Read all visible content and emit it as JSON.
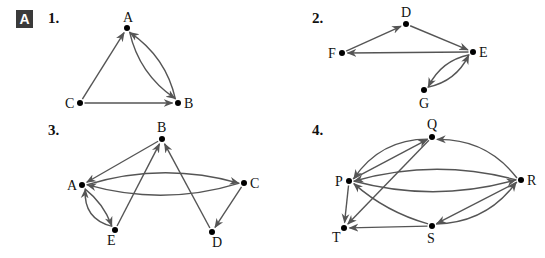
{
  "section_badge": "A",
  "edge_color": "#555555",
  "graphs": [
    {
      "number": "1.",
      "nodes": [
        {
          "id": "A",
          "x": 127,
          "y": 28,
          "label_dx": -4,
          "label_dy": -6
        },
        {
          "id": "B",
          "x": 178,
          "y": 103,
          "label_dx": 6,
          "label_dy": 5
        },
        {
          "id": "C",
          "x": 80,
          "y": 103,
          "label_dx": -15,
          "label_dy": 5
        }
      ],
      "edges": [
        {
          "from": "C",
          "to": "A",
          "curve": 0
        },
        {
          "from": "C",
          "to": "B",
          "curve": 0
        },
        {
          "from": "A",
          "to": "B",
          "curve": 10
        },
        {
          "from": "B",
          "to": "A",
          "curve": 10
        }
      ]
    },
    {
      "number": "2.",
      "nodes": [
        {
          "id": "D",
          "x": 406,
          "y": 24,
          "label_dx": -5,
          "label_dy": -7
        },
        {
          "id": "E",
          "x": 473,
          "y": 52,
          "label_dx": 6,
          "label_dy": 5
        },
        {
          "id": "F",
          "x": 342,
          "y": 53,
          "label_dx": -14,
          "label_dy": 5
        },
        {
          "id": "G",
          "x": 424,
          "y": 90,
          "label_dx": -5,
          "label_dy": 18
        }
      ],
      "edges": [
        {
          "from": "F",
          "to": "D",
          "curve": 0
        },
        {
          "from": "D",
          "to": "E",
          "curve": 0
        },
        {
          "from": "E",
          "to": "F",
          "curve": 0
        },
        {
          "from": "E",
          "to": "G",
          "curve": 8
        },
        {
          "from": "G",
          "to": "E",
          "curve": 8
        }
      ]
    },
    {
      "number": "3.",
      "nodes": [
        {
          "id": "B",
          "x": 162,
          "y": 139,
          "label_dx": -5,
          "label_dy": -7
        },
        {
          "id": "A",
          "x": 82,
          "y": 185,
          "label_dx": -15,
          "label_dy": 5
        },
        {
          "id": "C",
          "x": 244,
          "y": 183,
          "label_dx": 6,
          "label_dy": 5
        },
        {
          "id": "E",
          "x": 115,
          "y": 230,
          "label_dx": -8,
          "label_dy": 15
        },
        {
          "id": "D",
          "x": 212,
          "y": 232,
          "label_dx": 0,
          "label_dy": 15
        }
      ],
      "edges": [
        {
          "from": "B",
          "to": "A",
          "curve": 0
        },
        {
          "from": "A",
          "to": "C",
          "curve": -14
        },
        {
          "from": "C",
          "to": "A",
          "curve": -14
        },
        {
          "from": "A",
          "to": "E",
          "curve": -4
        },
        {
          "from": "E",
          "to": "A",
          "curve": -12
        },
        {
          "from": "E",
          "to": "B",
          "curve": 0
        },
        {
          "from": "D",
          "to": "B",
          "curve": 0
        },
        {
          "from": "C",
          "to": "D",
          "curve": 0
        }
      ]
    },
    {
      "number": "4.",
      "nodes": [
        {
          "id": "Q",
          "x": 432,
          "y": 137,
          "label_dx": -5,
          "label_dy": -8
        },
        {
          "id": "P",
          "x": 349,
          "y": 181,
          "label_dx": -14,
          "label_dy": 5
        },
        {
          "id": "R",
          "x": 521,
          "y": 180,
          "label_dx": 6,
          "label_dy": 5
        },
        {
          "id": "T",
          "x": 344,
          "y": 228,
          "label_dx": -12,
          "label_dy": 14
        },
        {
          "id": "S",
          "x": 432,
          "y": 226,
          "label_dx": -5,
          "label_dy": 17
        }
      ],
      "edges": [
        {
          "from": "Q",
          "to": "P",
          "curve": 14
        },
        {
          "from": "P",
          "to": "Q",
          "curve": 0
        },
        {
          "from": "R",
          "to": "Q",
          "curve": 14
        },
        {
          "from": "R",
          "to": "P",
          "curve": 14
        },
        {
          "from": "P",
          "to": "R",
          "curve": 14
        },
        {
          "from": "P",
          "to": "T",
          "curve": 0
        },
        {
          "from": "Q",
          "to": "T",
          "curve": 0
        },
        {
          "from": "S",
          "to": "T",
          "curve": 0
        },
        {
          "from": "S",
          "to": "P",
          "curve": -6
        },
        {
          "from": "R",
          "to": "S",
          "curve": 0
        },
        {
          "from": "S",
          "to": "R",
          "curve": 14
        }
      ]
    }
  ],
  "number_positions": [
    {
      "x": 48,
      "y": 10
    },
    {
      "x": 312,
      "y": 10
    },
    {
      "x": 48,
      "y": 122
    },
    {
      "x": 312,
      "y": 122
    }
  ]
}
